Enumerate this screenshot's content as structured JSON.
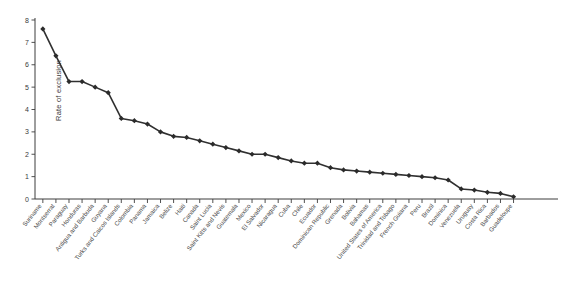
{
  "chart_data": {
    "type": "line",
    "title": "",
    "xlabel": "",
    "ylabel": "Rate of exclusion",
    "ylim": [
      0,
      8
    ],
    "yticks": [
      0,
      1,
      2,
      3,
      4,
      5,
      6,
      7,
      8
    ],
    "grid": false,
    "legend": "none",
    "marker": "diamond",
    "line_color": "#303030",
    "marker_color": "#2b2b2b",
    "categories": [
      "Suriname",
      "Montserrat",
      "Paraguay",
      "Honduras",
      "Antigua and Barbuda",
      "Guyana",
      "Turks and Caicos Islands",
      "Colombia",
      "Panama",
      "Jamaica",
      "Belize",
      "Haiti",
      "Canada",
      "Saint Lucia",
      "Saint Kitts and Nevis",
      "Guatemala",
      "Mexico",
      "El Salvador",
      "Nicaragua",
      "Cuba",
      "Chile",
      "Ecuador",
      "Dominican Republic",
      "Grenada",
      "Bolivia",
      "Bahamas",
      "United States of America",
      "Trinidad and Tobago",
      "French Guiana",
      "Peru",
      "Brazil",
      "Dominica",
      "Venezuela",
      "Uruguay",
      "Costa Rica",
      "Barbados",
      "Guadeloupe"
    ],
    "values": [
      7.6,
      6.4,
      5.25,
      5.25,
      5.0,
      4.75,
      3.6,
      3.5,
      3.35,
      3.0,
      2.8,
      2.75,
      2.6,
      2.45,
      2.3,
      2.15,
      2.0,
      2.0,
      1.85,
      1.7,
      1.6,
      1.6,
      1.4,
      1.3,
      1.25,
      1.2,
      1.15,
      1.1,
      1.05,
      1.0,
      0.95,
      0.85,
      0.45,
      0.4,
      0.3,
      0.25,
      0.1
    ]
  }
}
